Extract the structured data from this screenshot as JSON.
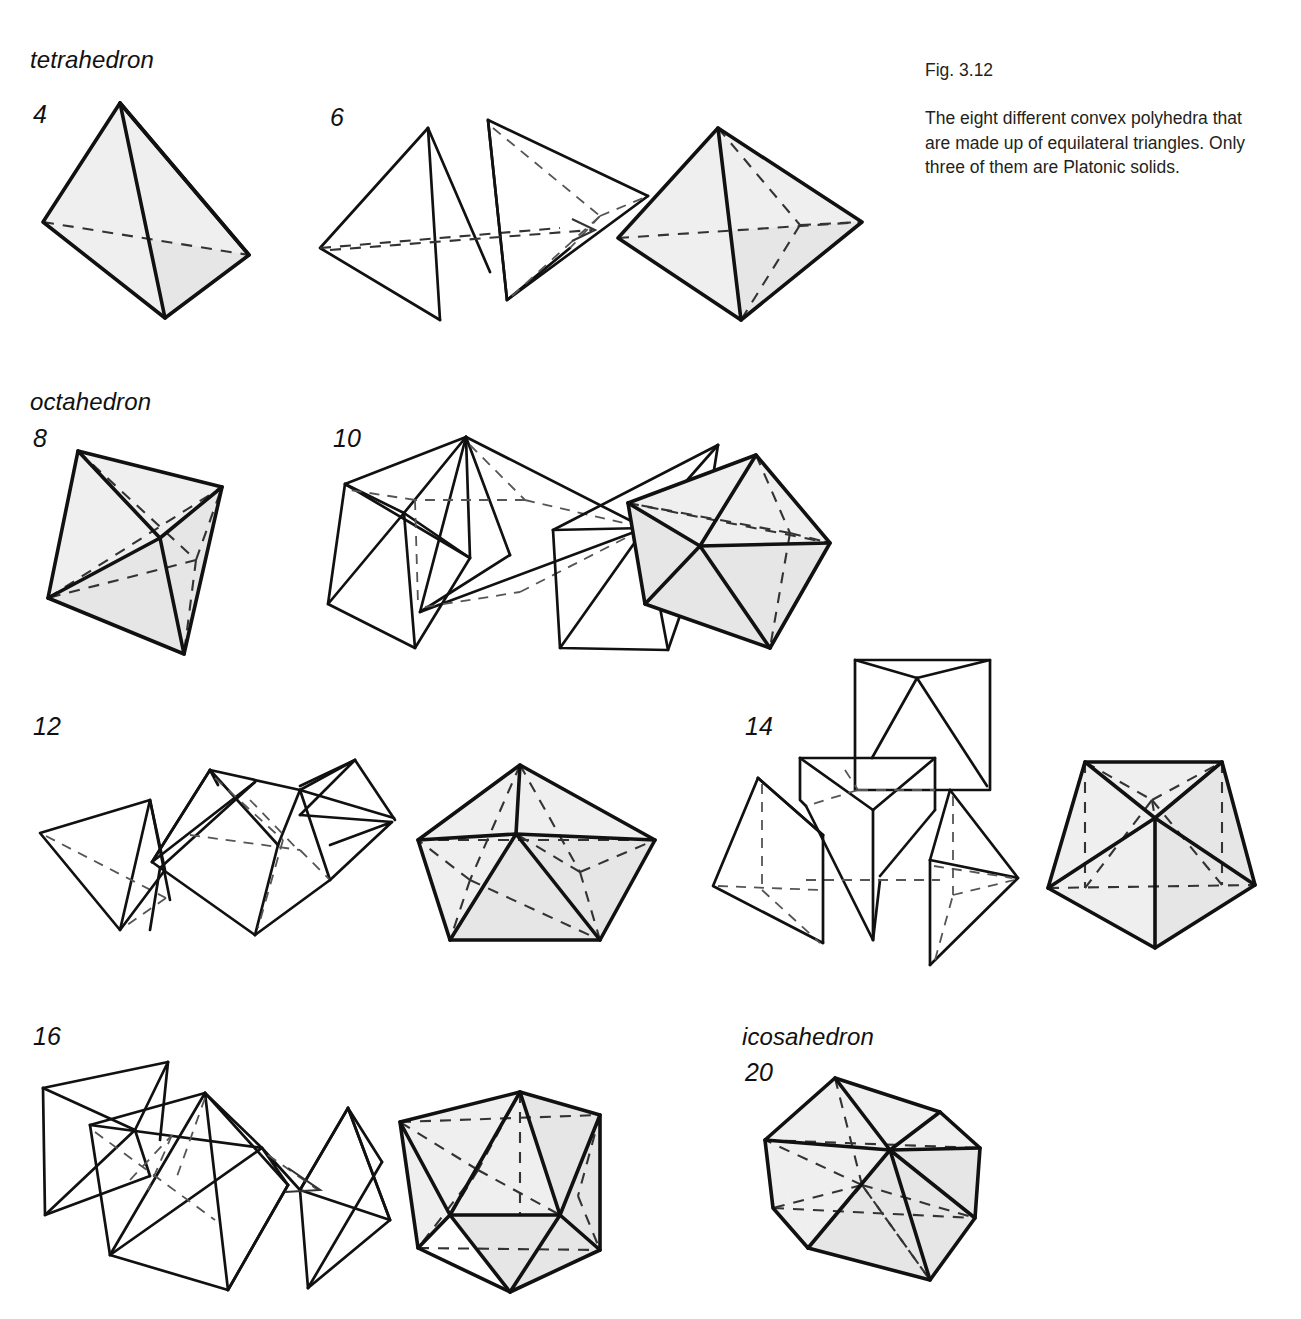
{
  "caption": {
    "figure_number": "Fig. 3.12",
    "text": "The eight different convex polyhedra that are made up of equilateral triangles. Only three of them are Platonic solids."
  },
  "groups": [
    {
      "id": "tetrahedron",
      "name_label": "tetrahedron",
      "count_label": "4",
      "is_platonic": true,
      "faces": 4,
      "description": "Single shaded tetrahedron with dashed hidden back edge."
    },
    {
      "id": "triangular-bipyramid",
      "name_label": "",
      "count_label": "6",
      "is_platonic": false,
      "faces": 6,
      "description": "Two tetrahedra shown separated with an arrow, joined into a shaded triangular bipyramid."
    },
    {
      "id": "octahedron",
      "name_label": "octahedron",
      "count_label": "8",
      "is_platonic": true,
      "faces": 8,
      "description": "Single shaded octahedron with dashed hidden edges."
    },
    {
      "id": "pentagonal-bipyramid-exploded",
      "name_label": "",
      "count_label": "10",
      "is_platonic": false,
      "faces": 10,
      "description": "Octahedron plus two tetrahedra exploded, assembled into a shaded 10-faced solid."
    },
    {
      "id": "pentagonal-bipyramid",
      "name_label": "",
      "count_label": "12",
      "is_platonic": false,
      "faces": 12,
      "description": "Exploded pieces shown at left, assembled shaded pentagonal-bipyramid-like solid at right."
    },
    {
      "id": "solid-14",
      "name_label": "",
      "count_label": "14",
      "is_platonic": false,
      "faces": 14,
      "description": "Exploded pieces around a central wedge, assembled shaded 14-faced solid at right."
    },
    {
      "id": "solid-16",
      "name_label": "",
      "count_label": "16",
      "is_platonic": false,
      "faces": 16,
      "description": "Exploded octahedra and tetrahedron, assembled shaded 16-faced solid at right."
    },
    {
      "id": "icosahedron",
      "name_label": "icosahedron",
      "count_label": "20",
      "is_platonic": true,
      "faces": 20,
      "description": "Single shaded icosahedron with dashed hidden edges."
    }
  ],
  "style": {
    "background": "#ffffff",
    "ink": "#111111",
    "face_fill": "#e6e6e6",
    "face_fill_dark": "#d2d2d2",
    "face_fill_light": "#efefef",
    "hidden_edge": "#333333"
  }
}
